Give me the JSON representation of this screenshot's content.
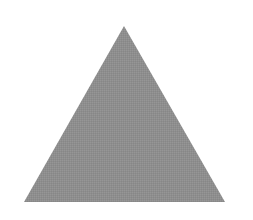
{
  "diagram": {
    "shape": "triangle",
    "fill_color": "#8e8e8e",
    "background_color": "#ffffff",
    "vertices": {
      "apex": [
        124,
        26
      ],
      "bottom_left": [
        24,
        202
      ],
      "bottom_right": [
        225,
        202
      ]
    }
  }
}
